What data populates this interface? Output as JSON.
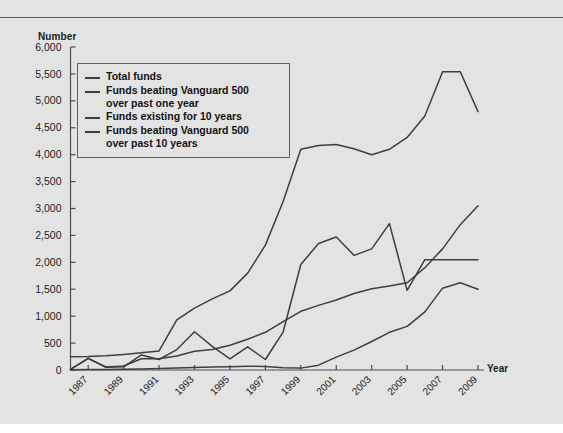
{
  "figure": {
    "background_color": "#e3e3e3",
    "line_color": "#3a3f42",
    "axis_color": "#4a4f52",
    "y_axis_title": "Number",
    "x_axis_title": "Year"
  },
  "legend": {
    "items": [
      {
        "label": "Total funds",
        "swatch_name": "legend-swatch-total-funds"
      },
      {
        "label": "Funds beating Vanguard 500\nover past one year",
        "swatch_name": "legend-swatch-beating-one-year"
      },
      {
        "label": "Funds existing for 10 years",
        "swatch_name": "legend-swatch-existing-10-years"
      },
      {
        "label": "Funds beating Vanguard 500\nover past 10 years",
        "swatch_name": "legend-swatch-beating-10-years"
      }
    ]
  },
  "chart_data": {
    "type": "line",
    "title": "",
    "xlabel": "Year",
    "ylabel": "Number",
    "xlim": [
      1986,
      2009
    ],
    "ylim": [
      0,
      6000
    ],
    "ytick_labels": [
      "6,000",
      "5,500",
      "5,000",
      "4,500",
      "4,000",
      "3,500",
      "3,000",
      "2,500",
      "2,000",
      "1,500",
      "1,000",
      "500",
      "0"
    ],
    "ytick_values": [
      6000,
      5500,
      5000,
      4500,
      4000,
      3500,
      3000,
      2500,
      2000,
      1500,
      1000,
      500,
      0
    ],
    "xtick_labels": [
      "1987",
      "1989",
      "1991",
      "1993",
      "1995",
      "1997",
      "1999",
      "2001",
      "2003",
      "2005",
      "2007",
      "2009"
    ],
    "xtick_values": [
      1987,
      1989,
      1991,
      1993,
      1995,
      1997,
      1999,
      2001,
      2003,
      2005,
      2007,
      2009
    ],
    "grid": false,
    "legend_position": "upper-left-inside",
    "x": [
      1986,
      1987,
      1988,
      1989,
      1990,
      1991,
      1992,
      1993,
      1994,
      1995,
      1996,
      1997,
      1998,
      1999,
      2000,
      2001,
      2002,
      2003,
      2004,
      2005,
      2006,
      2007,
      2008,
      2009
    ],
    "series": [
      {
        "name": "Total funds",
        "values": [
          245,
          250,
          265,
          290,
          320,
          355,
          930,
          1150,
          1320,
          1470,
          1800,
          2320,
          3130,
          4100,
          4170,
          4190,
          4110,
          4000,
          4100,
          4320,
          4720,
          5540,
          5540,
          4800
        ]
      },
      {
        "name": "Funds beating Vanguard 500 over past one year",
        "values": [
          10,
          215,
          50,
          60,
          280,
          195,
          380,
          710,
          440,
          205,
          430,
          195,
          705,
          1960,
          2350,
          2470,
          2130,
          2250,
          2720,
          1480,
          2050,
          2050,
          2050,
          2050
        ]
      },
      {
        "name": "Funds existing for 10 years",
        "values": [
          10,
          215,
          55,
          75,
          210,
          210,
          260,
          350,
          380,
          460,
          570,
          700,
          900,
          1090,
          1200,
          1300,
          1420,
          1510,
          1560,
          1620,
          1900,
          2250,
          2700,
          3050
        ]
      },
      {
        "name": "Funds beating Vanguard 500 over past 10 years",
        "values": [
          5,
          8,
          10,
          15,
          20,
          30,
          35,
          45,
          55,
          60,
          70,
          65,
          40,
          35,
          90,
          240,
          370,
          530,
          700,
          810,
          1080,
          1520,
          1620,
          1500
        ]
      }
    ]
  }
}
